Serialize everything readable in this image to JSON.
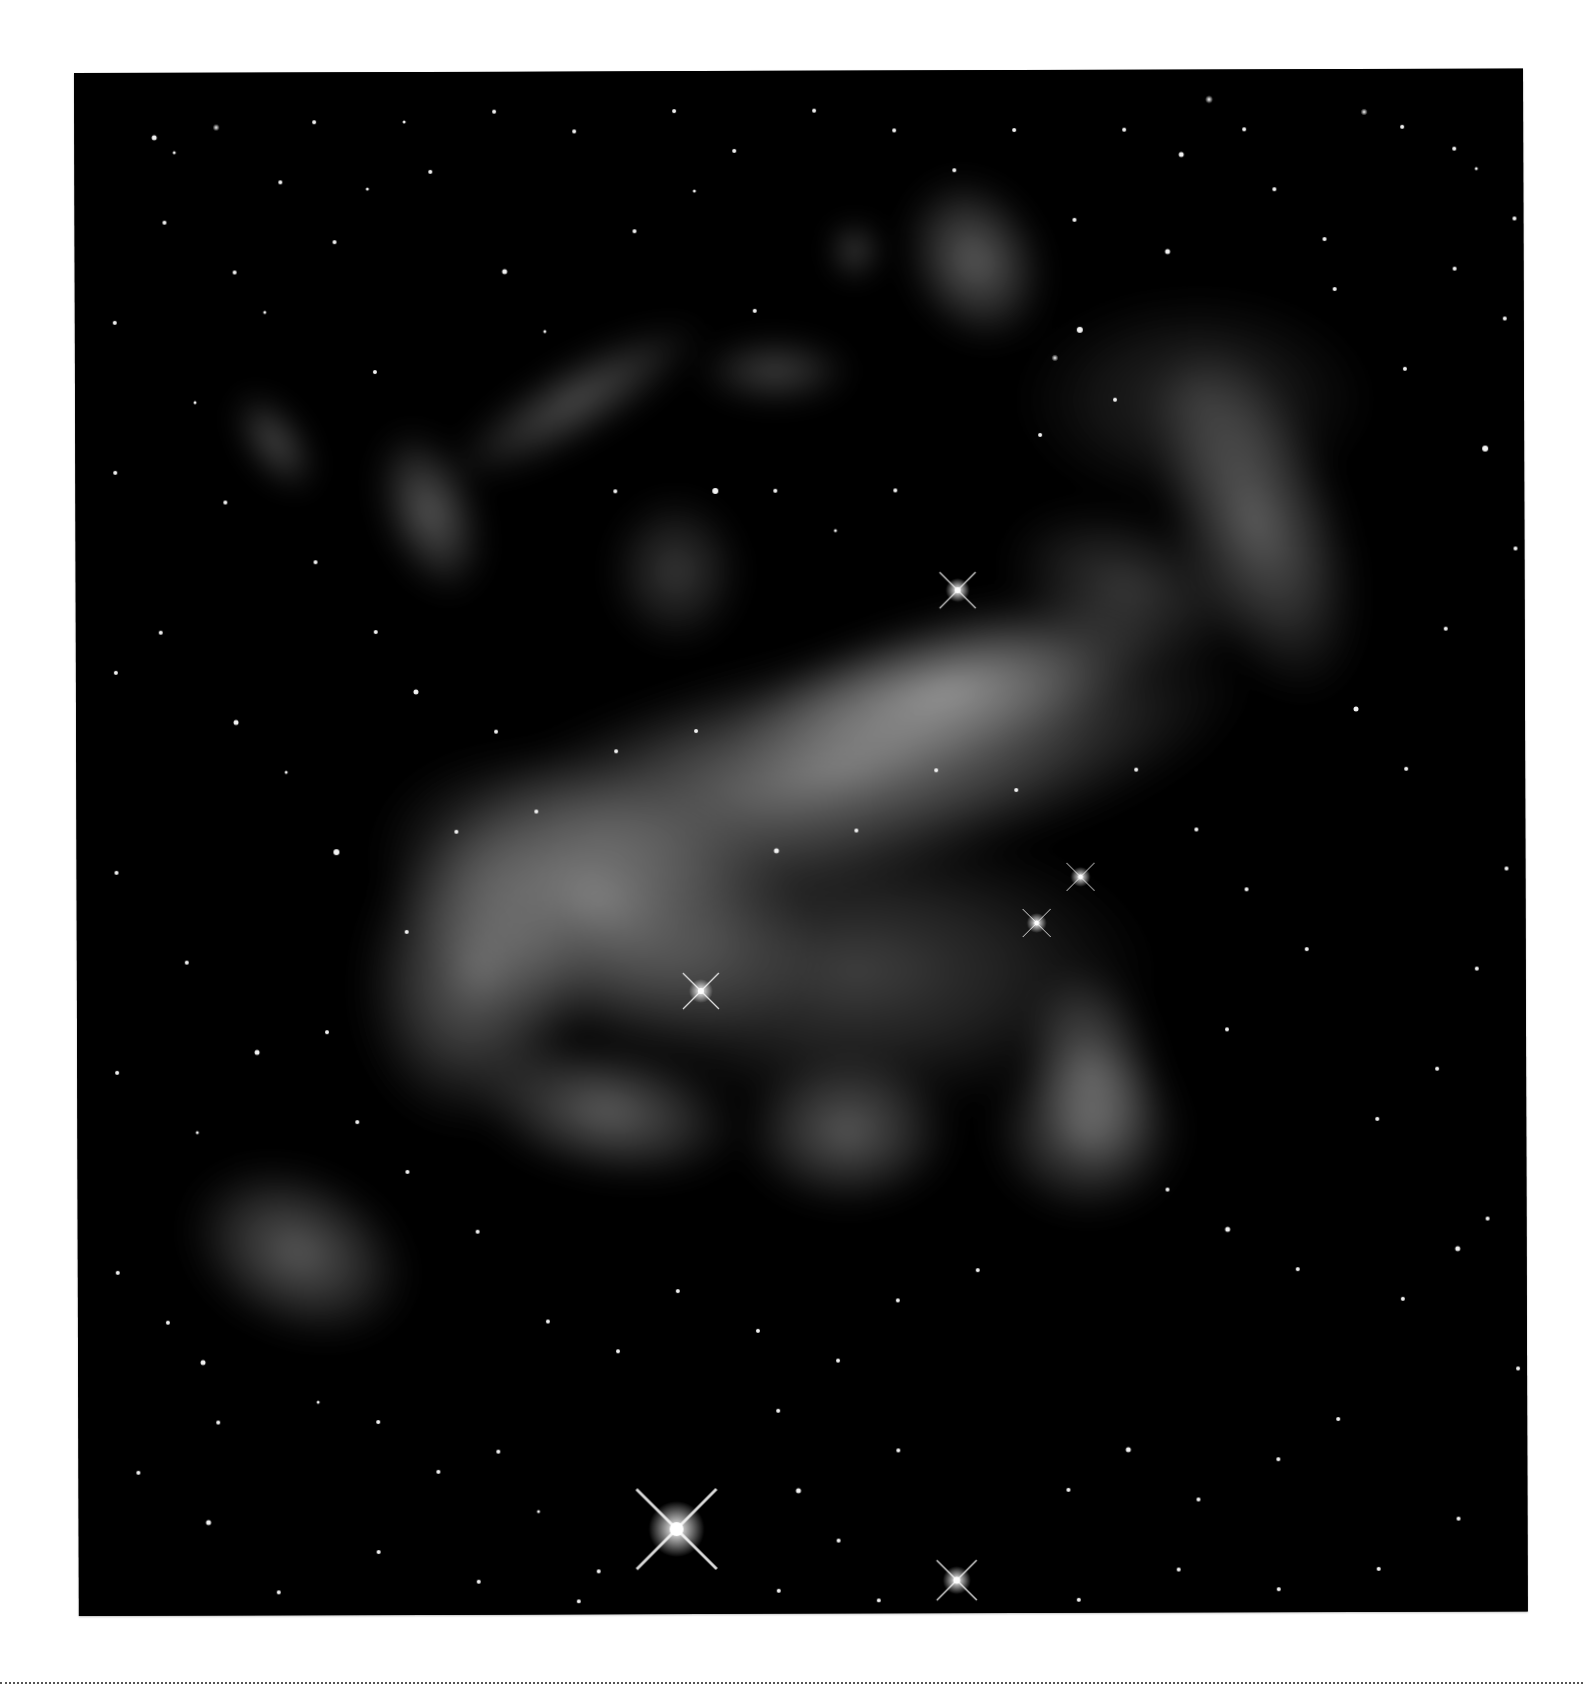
{
  "image": {
    "subject": "nebula",
    "colors": {
      "page": "#ffffff",
      "sky": "#000000",
      "gas": "#cfcfcf",
      "rule": "#555555"
    },
    "frame": {
      "x": 74,
      "y": 73,
      "width": 1449,
      "height": 1543
    },
    "nebula_clouds": [
      {
        "cx": 760,
        "cy": 700,
        "rx": 420,
        "ry": 120,
        "rot": -12,
        "op": 0.55
      },
      {
        "cx": 520,
        "cy": 830,
        "rx": 230,
        "ry": 140,
        "rot": 20,
        "op": 0.55
      },
      {
        "cx": 400,
        "cy": 900,
        "rx": 120,
        "ry": 160,
        "rot": 10,
        "op": 0.45
      },
      {
        "cx": 870,
        "cy": 620,
        "rx": 230,
        "ry": 80,
        "rot": -15,
        "op": 0.55
      },
      {
        "cx": 780,
        "cy": 900,
        "rx": 300,
        "ry": 150,
        "rot": 0,
        "op": 0.28
      },
      {
        "cx": 530,
        "cy": 1040,
        "rx": 140,
        "ry": 70,
        "rot": 10,
        "op": 0.42
      },
      {
        "cx": 770,
        "cy": 1060,
        "rx": 110,
        "ry": 80,
        "rot": 0,
        "op": 0.4
      },
      {
        "cx": 1010,
        "cy": 1060,
        "rx": 100,
        "ry": 90,
        "rot": 0,
        "op": 0.38
      },
      {
        "cx": 1015,
        "cy": 1000,
        "rx": 70,
        "ry": 110,
        "rot": -10,
        "op": 0.4
      },
      {
        "cx": 1180,
        "cy": 450,
        "rx": 90,
        "ry": 190,
        "rot": -20,
        "op": 0.42
      },
      {
        "cx": 1120,
        "cy": 330,
        "rx": 180,
        "ry": 110,
        "rot": 0,
        "op": 0.18
      },
      {
        "cx": 900,
        "cy": 190,
        "rx": 70,
        "ry": 90,
        "rot": -25,
        "op": 0.42
      },
      {
        "cx": 1050,
        "cy": 520,
        "rx": 130,
        "ry": 80,
        "rot": 20,
        "op": 0.25
      },
      {
        "cx": 220,
        "cy": 1180,
        "rx": 120,
        "ry": 85,
        "rot": 25,
        "op": 0.4
      },
      {
        "cx": 355,
        "cy": 440,
        "rx": 50,
        "ry": 90,
        "rot": -20,
        "op": 0.4
      },
      {
        "cx": 500,
        "cy": 330,
        "rx": 150,
        "ry": 40,
        "rot": -30,
        "op": 0.35
      },
      {
        "cx": 600,
        "cy": 500,
        "rx": 70,
        "ry": 80,
        "rot": 0,
        "op": 0.25
      },
      {
        "cx": 200,
        "cy": 370,
        "rx": 30,
        "ry": 60,
        "rot": -35,
        "op": 0.35
      },
      {
        "cx": 700,
        "cy": 300,
        "rx": 80,
        "ry": 35,
        "rot": 0,
        "op": 0.3
      },
      {
        "cx": 780,
        "cy": 180,
        "rx": 25,
        "ry": 30,
        "rot": 0,
        "op": 0.35
      }
    ],
    "bright_stars": [
      {
        "x": 598,
        "y": 1458,
        "r": 14,
        "spike": 40
      },
      {
        "x": 878,
        "y": 1510,
        "r": 7,
        "spike": 20
      },
      {
        "x": 882,
        "y": 520,
        "r": 6,
        "spike": 18
      },
      {
        "x": 624,
        "y": 920,
        "r": 6,
        "spike": 18
      },
      {
        "x": 1004,
        "y": 807,
        "r": 5,
        "spike": 14
      },
      {
        "x": 960,
        "y": 853,
        "r": 5,
        "spike": 14
      }
    ],
    "stars": [
      [
        80,
        65,
        2.5
      ],
      [
        100,
        80,
        1.5
      ],
      [
        142,
        55,
        3.5
      ],
      [
        206,
        110,
        2
      ],
      [
        293,
        117,
        1.5
      ],
      [
        356,
        100,
        2
      ],
      [
        1107,
        85,
        2.5
      ],
      [
        1135,
        30,
        4
      ],
      [
        1290,
        43,
        3.5
      ],
      [
        1328,
        58,
        2
      ],
      [
        1380,
        80,
        2
      ],
      [
        1402,
        100,
        1.5
      ],
      [
        1093,
        182,
        2.5
      ],
      [
        1005,
        260,
        3
      ],
      [
        980,
        288,
        3.5
      ],
      [
        965,
        365,
        2
      ],
      [
        1040,
        330,
        2
      ],
      [
        160,
        200,
        2
      ],
      [
        190,
        240,
        1.5
      ],
      [
        260,
        170,
        2
      ],
      [
        300,
        300,
        2
      ],
      [
        120,
        330,
        1.5
      ],
      [
        85,
        560,
        2
      ],
      [
        160,
        650,
        2.5
      ],
      [
        210,
        700,
        1.5
      ],
      [
        260,
        780,
        3
      ],
      [
        110,
        890,
        2
      ],
      [
        180,
        980,
        2.5
      ],
      [
        120,
        1060,
        1.5
      ],
      [
        90,
        1250,
        2
      ],
      [
        125,
        1290,
        2.5
      ],
      [
        140,
        1350,
        2
      ],
      [
        240,
        1330,
        1.5
      ],
      [
        300,
        1350,
        2
      ],
      [
        360,
        1400,
        2
      ],
      [
        420,
        1380,
        2
      ],
      [
        460,
        1440,
        1.5
      ],
      [
        520,
        1500,
        2
      ],
      [
        700,
        1340,
        2
      ],
      [
        720,
        1420,
        2.5
      ],
      [
        760,
        1470,
        2
      ],
      [
        820,
        1380,
        2
      ],
      [
        990,
        1420,
        2
      ],
      [
        1050,
        1380,
        2.5
      ],
      [
        1120,
        1430,
        2
      ],
      [
        1200,
        1390,
        2
      ],
      [
        1260,
        1350,
        2
      ],
      [
        1325,
        1230,
        2
      ],
      [
        1380,
        1180,
        2.5
      ],
      [
        1410,
        1150,
        2
      ],
      [
        1300,
        1050,
        2
      ],
      [
        1360,
        1000,
        2
      ],
      [
        1400,
        900,
        2
      ],
      [
        1430,
        800,
        2
      ],
      [
        1330,
        700,
        2
      ],
      [
        1280,
        640,
        2.5
      ],
      [
        1370,
        560,
        2
      ],
      [
        1440,
        480,
        2
      ],
      [
        1410,
        380,
        3
      ],
      [
        1330,
        300,
        2
      ],
      [
        1260,
        220,
        2
      ],
      [
        1380,
        200,
        2
      ],
      [
        1440,
        150,
        2
      ],
      [
        560,
        160,
        2
      ],
      [
        620,
        120,
        1.5
      ],
      [
        680,
        240,
        2
      ],
      [
        430,
        200,
        2.5
      ],
      [
        470,
        260,
        1.5
      ],
      [
        540,
        420,
        2
      ],
      [
        640,
        420,
        3
      ],
      [
        700,
        420,
        2
      ],
      [
        760,
        460,
        1.5
      ],
      [
        820,
        420,
        2
      ],
      [
        300,
        560,
        2
      ],
      [
        340,
        620,
        2.5
      ],
      [
        420,
        660,
        2
      ],
      [
        460,
        740,
        2
      ],
      [
        540,
        680,
        2
      ],
      [
        620,
        660,
        2
      ],
      [
        700,
        780,
        2.5
      ],
      [
        780,
        760,
        2
      ],
      [
        860,
        700,
        2
      ],
      [
        940,
        720,
        2
      ],
      [
        1060,
        700,
        2
      ],
      [
        1120,
        760,
        2
      ],
      [
        1170,
        820,
        2
      ],
      [
        1230,
        880,
        2
      ],
      [
        1150,
        960,
        2
      ],
      [
        1090,
        1120,
        2
      ],
      [
        1150,
        1160,
        2.5
      ],
      [
        1220,
        1200,
        2
      ],
      [
        900,
        1200,
        2
      ],
      [
        820,
        1230,
        2
      ],
      [
        760,
        1290,
        2
      ],
      [
        680,
        1260,
        2
      ],
      [
        600,
        1220,
        2
      ],
      [
        540,
        1280,
        2
      ],
      [
        470,
        1250,
        2
      ],
      [
        400,
        1160,
        2
      ],
      [
        330,
        1100,
        2
      ],
      [
        280,
        1050,
        2
      ],
      [
        250,
        960,
        2
      ],
      [
        330,
        860,
        2
      ],
      [
        380,
        760,
        2
      ],
      [
        240,
        490,
        2
      ],
      [
        150,
        430,
        2
      ],
      [
        90,
        150,
        2
      ],
      [
        1000,
        150,
        2
      ],
      [
        1200,
        120,
        2
      ],
      [
        1250,
        170,
        2
      ],
      [
        1170,
        60,
        2
      ],
      [
        1050,
        60,
        2
      ],
      [
        940,
        60,
        2
      ],
      [
        880,
        100,
        2
      ],
      [
        820,
        60,
        2
      ],
      [
        740,
        40,
        2
      ],
      [
        660,
        80,
        2
      ],
      [
        600,
        40,
        2
      ],
      [
        500,
        60,
        2
      ],
      [
        420,
        40,
        2
      ],
      [
        330,
        50,
        1.5
      ],
      [
        240,
        50,
        2
      ],
      [
        1470,
        40,
        2
      ],
      [
        1430,
        250,
        2
      ],
      [
        1460,
        600,
        2
      ],
      [
        1460,
        1050,
        2
      ],
      [
        1440,
        1300,
        2
      ],
      [
        1380,
        1450,
        2
      ],
      [
        1300,
        1500,
        2
      ],
      [
        1200,
        1520,
        2
      ],
      [
        1100,
        1500,
        2
      ],
      [
        1000,
        1530,
        2
      ],
      [
        800,
        1530,
        2
      ],
      [
        700,
        1520,
        2
      ],
      [
        500,
        1530,
        2
      ],
      [
        400,
        1510,
        2
      ],
      [
        300,
        1480,
        2
      ],
      [
        200,
        1520,
        2
      ],
      [
        130,
        1450,
        2.5
      ],
      [
        60,
        1400,
        2
      ],
      [
        40,
        1200,
        2
      ],
      [
        40,
        1000,
        2
      ],
      [
        40,
        800,
        2
      ],
      [
        40,
        600,
        2
      ],
      [
        40,
        400,
        2
      ],
      [
        40,
        250,
        2
      ]
    ]
  }
}
